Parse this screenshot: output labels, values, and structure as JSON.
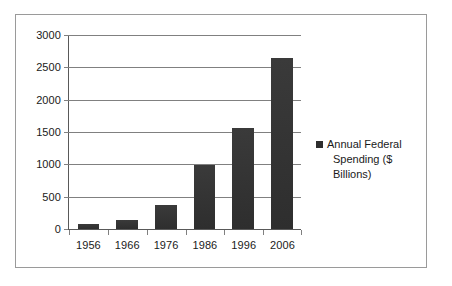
{
  "chart_data": {
    "type": "bar",
    "title": "",
    "subtitle": "",
    "xlabel": "",
    "ylabel": "",
    "categories": [
      "1956",
      "1966",
      "1976",
      "1986",
      "1996",
      "2006"
    ],
    "series": [
      {
        "name": "Annual Federal Spending ($ Billions)",
        "values": [
          70,
          135,
          370,
          990,
          1560,
          2650
        ]
      }
    ],
    "values": [
      70,
      135,
      370,
      990,
      1560,
      2650
    ],
    "ylim": [
      0,
      3000
    ],
    "yticks": [
      0,
      500,
      1000,
      1500,
      2000,
      2500,
      3000
    ],
    "ytick_labels": [
      "0",
      "500",
      "1000",
      "1500",
      "2000",
      "2500",
      "3000"
    ],
    "grid": true,
    "grid_axis": "y",
    "legend_position": "right",
    "legend_entries": [
      {
        "label_line_1": "Annual Federal",
        "label_line_2": "Spending ($ Billions)",
        "full_label": "Annual Federal Spending ($ Billions)",
        "marker": "square",
        "color": "#2e2e2e"
      }
    ],
    "bar_color": "#333333",
    "gridline_color": "#808080",
    "axis_color": "#595959",
    "border_color": "#9a9a9a",
    "background_color": "#ffffff"
  }
}
